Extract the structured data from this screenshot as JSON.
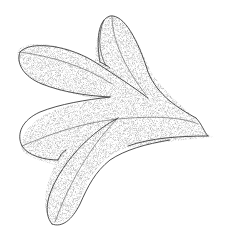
{
  "image": {
    "subject": "Stippled botanical illustration of a four-lobed leaf",
    "background": "#ffffff",
    "ink": "#3a3a3a",
    "stipple": "#9a9a9a",
    "lobes": [
      {
        "name": "upper-left-lobe"
      },
      {
        "name": "top-lobe"
      },
      {
        "name": "lower-left-lobe"
      },
      {
        "name": "bottom-lobe"
      }
    ]
  }
}
